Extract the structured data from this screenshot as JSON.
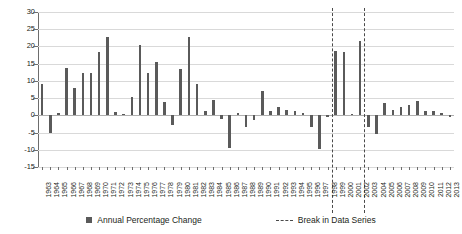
{
  "chart_data": {
    "type": "bar",
    "title": "",
    "xlabel": "",
    "ylabel": "",
    "ylim": [
      -15,
      30
    ],
    "ytick_step": 5,
    "yticks": [
      30,
      25,
      20,
      15,
      10,
      5,
      0,
      -5,
      -10,
      -15
    ],
    "grid": true,
    "bar_color": "#5a5a5a",
    "break_color": "#4a4a4a",
    "legend_position": "bottom",
    "categories": [
      "1963",
      "1964",
      "1965",
      "1966",
      "1967",
      "1968",
      "1969",
      "1970",
      "1971",
      "1972",
      "1973",
      "1974",
      "1975",
      "1976",
      "1977",
      "1978",
      "1979",
      "1980",
      "1981",
      "1982",
      "1983",
      "1984",
      "1985",
      "1986",
      "1987",
      "1988",
      "1989",
      "1990",
      "1991",
      "1992",
      "1993",
      "1994",
      "1995",
      "1996",
      "1997",
      "1998",
      "1999",
      "2000",
      "2001",
      "2002",
      "2003",
      "2004",
      "2005",
      "2006",
      "2007",
      "2008",
      "2009",
      "2010",
      "2011",
      "2012",
      "2013"
    ],
    "values": [
      9.2,
      -5.2,
      0.6,
      13.7,
      7.9,
      12.3,
      12.4,
      18.3,
      22.7,
      1.0,
      0.5,
      5.4,
      20.5,
      12.3,
      15.5,
      3.8,
      -2.7,
      13.4,
      22.6,
      9.0,
      1.2,
      4.5,
      -1.0,
      -9.5,
      0.6,
      -3.4,
      -1.5,
      7.2,
      1.2,
      2.5,
      1.5,
      1.3,
      0.8,
      -3.3,
      -9.8,
      -0.4,
      18.8,
      18.3,
      0.3,
      21.7,
      -3.5,
      -5.5,
      3.6,
      1.6,
      2.3,
      2.9,
      4.2,
      1.4,
      1.2,
      0.6,
      -0.6
    ],
    "break_after_categories": [
      "1998",
      "2002"
    ],
    "legend": [
      {
        "label": "Annual Percentage Change",
        "marker": "square",
        "color": "#5a5a5a"
      },
      {
        "label": "Break in Data Series",
        "marker": "dashed-line",
        "color": "#4a4a4a"
      }
    ]
  }
}
